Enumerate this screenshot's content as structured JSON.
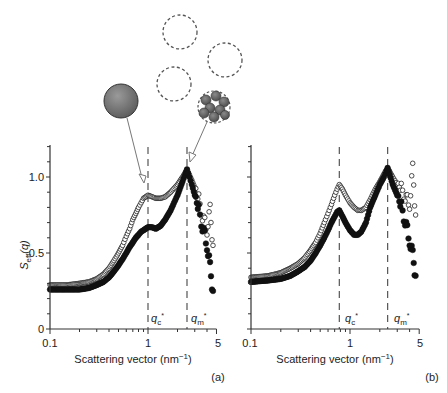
{
  "chart_data": [
    {
      "type": "scatter",
      "panel": "(a)",
      "xlabel": "Scattering vector (nm⁻¹)",
      "ylabel": "S_eff(q)",
      "xscale": "log",
      "xlim": [
        0.1,
        5
      ],
      "ylim": [
        0,
        1.2
      ],
      "xticks": [
        "0.1",
        "1",
        "5"
      ],
      "yticks": [
        "0",
        "0.5",
        "1.0"
      ],
      "vlines": [
        {
          "label": "qc*",
          "x": 1.0
        },
        {
          "label": "qm*",
          "x": 2.5
        }
      ],
      "series": [
        {
          "name": "open-circles",
          "marker": "open",
          "x": [
            0.1,
            0.15,
            0.2,
            0.25,
            0.3,
            0.35,
            0.4,
            0.45,
            0.5,
            0.55,
            0.6,
            0.65,
            0.7,
            0.75,
            0.8,
            0.85,
            0.9,
            0.95,
            1.0,
            1.1,
            1.2,
            1.35,
            1.5,
            1.7,
            2.0,
            2.25,
            2.5,
            2.8,
            3.0,
            3.3,
            3.6,
            4.0,
            4.3,
            4.6
          ],
          "y": [
            0.29,
            0.29,
            0.3,
            0.31,
            0.33,
            0.36,
            0.4,
            0.45,
            0.5,
            0.55,
            0.61,
            0.66,
            0.72,
            0.76,
            0.8,
            0.83,
            0.86,
            0.87,
            0.88,
            0.87,
            0.86,
            0.86,
            0.87,
            0.9,
            0.95,
            1.0,
            1.05,
            0.98,
            0.93,
            0.85,
            0.75,
            0.65,
            0.78,
            0.55
          ]
        },
        {
          "name": "filled-circles",
          "marker": "filled",
          "x": [
            0.1,
            0.15,
            0.2,
            0.25,
            0.3,
            0.35,
            0.4,
            0.45,
            0.5,
            0.55,
            0.6,
            0.65,
            0.7,
            0.75,
            0.8,
            0.85,
            0.9,
            0.95,
            1.0,
            1.1,
            1.2,
            1.35,
            1.5,
            1.7,
            2.0,
            2.25,
            2.5,
            2.8,
            3.0,
            3.3,
            3.6,
            4.0,
            4.3,
            4.6
          ],
          "y": [
            0.26,
            0.26,
            0.26,
            0.27,
            0.29,
            0.31,
            0.34,
            0.38,
            0.42,
            0.46,
            0.5,
            0.54,
            0.57,
            0.6,
            0.62,
            0.64,
            0.65,
            0.66,
            0.67,
            0.67,
            0.66,
            0.68,
            0.72,
            0.78,
            0.88,
            0.97,
            1.05,
            0.95,
            0.88,
            0.78,
            0.68,
            0.55,
            0.4,
            0.25
          ]
        }
      ]
    },
    {
      "type": "scatter",
      "panel": "(b)",
      "xlabel": "Scattering vector (nm⁻¹)",
      "ylabel": "",
      "xscale": "log",
      "xlim": [
        0.1,
        5
      ],
      "ylim": [
        0,
        1.2
      ],
      "xticks": [
        "0.1",
        "1",
        "5"
      ],
      "yticks": [],
      "vlines": [
        {
          "label": "qc*",
          "x": 0.78
        },
        {
          "label": "qm*",
          "x": 2.4
        }
      ],
      "series": [
        {
          "name": "open-circles",
          "marker": "open",
          "x": [
            0.1,
            0.15,
            0.2,
            0.25,
            0.3,
            0.35,
            0.4,
            0.45,
            0.5,
            0.55,
            0.6,
            0.65,
            0.7,
            0.74,
            0.78,
            0.84,
            0.9,
            1.0,
            1.1,
            1.2,
            1.3,
            1.45,
            1.6,
            1.8,
            2.0,
            2.2,
            2.4,
            2.7,
            3.0,
            3.3,
            3.6,
            4.0,
            4.3,
            4.6
          ],
          "y": [
            0.34,
            0.35,
            0.37,
            0.4,
            0.43,
            0.47,
            0.52,
            0.57,
            0.63,
            0.7,
            0.76,
            0.82,
            0.88,
            0.92,
            0.95,
            0.92,
            0.88,
            0.83,
            0.8,
            0.78,
            0.78,
            0.8,
            0.85,
            0.92,
            0.97,
            1.02,
            1.06,
            1.0,
            0.95,
            0.92,
            0.88,
            0.82,
            1.05,
            0.75
          ]
        },
        {
          "name": "filled-circles",
          "marker": "filled",
          "x": [
            0.1,
            0.15,
            0.2,
            0.25,
            0.3,
            0.35,
            0.4,
            0.45,
            0.5,
            0.55,
            0.6,
            0.65,
            0.7,
            0.74,
            0.78,
            0.84,
            0.9,
            1.0,
            1.1,
            1.2,
            1.3,
            1.45,
            1.6,
            1.8,
            2.0,
            2.2,
            2.4,
            2.7,
            3.0,
            3.3,
            3.6,
            4.0,
            4.3,
            4.6
          ],
          "y": [
            0.31,
            0.32,
            0.33,
            0.35,
            0.38,
            0.41,
            0.45,
            0.5,
            0.55,
            0.6,
            0.65,
            0.7,
            0.74,
            0.77,
            0.78,
            0.74,
            0.7,
            0.65,
            0.62,
            0.62,
            0.64,
            0.7,
            0.8,
            0.88,
            0.95,
            1.0,
            1.06,
            0.95,
            0.88,
            0.8,
            0.72,
            0.58,
            0.48,
            0.35
          ]
        }
      ]
    }
  ],
  "labels": {
    "ylabel_main": "S",
    "ylabel_sub": "eff",
    "ylabel_tail": "(q)",
    "ytick_0": "0",
    "ytick_05": "0.5",
    "ytick_10": "1.0",
    "xtick_01": "0.1",
    "xtick_1": "1",
    "xtick_5": "5",
    "xlabel_pre": "Scattering vector (nm",
    "xlabel_sup": "−1",
    "xlabel_post": ")",
    "q_letter": "q",
    "qc_sub": "c",
    "qm_sub": "m",
    "star": "*",
    "panel_a": "(a)",
    "panel_b": "(b)"
  },
  "illustration": {
    "items": [
      "solid-sphere",
      "dashed-circle",
      "dashed-circle",
      "dashed-circle",
      "particle-cluster"
    ],
    "colors": {
      "sphere": "#7a7a7a",
      "dash": "#555555",
      "arrow": "#777777"
    }
  }
}
